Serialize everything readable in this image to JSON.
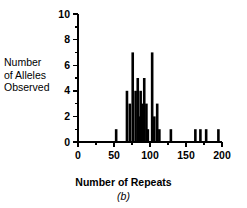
{
  "figure": {
    "caption_label": "(b)",
    "ylabel_line1": "Number",
    "ylabel_line2": "of Alleles",
    "ylabel_line3": "Observed",
    "xlabel": "Number of Repeats"
  },
  "chart_data": {
    "type": "bar",
    "title": "",
    "subtitle": "",
    "xlabel": "Number of Repeats",
    "ylabel": "Number of Alleles Observed",
    "xlim": [
      0,
      200
    ],
    "ylim": [
      0,
      10
    ],
    "xticks": [
      0,
      50,
      100,
      150,
      200
    ],
    "xtick_labels": [
      "0",
      "50",
      "100",
      "150",
      "200"
    ],
    "xminor_ticks": [
      25,
      75,
      125,
      175
    ],
    "yticks": [
      0,
      2,
      4,
      6,
      8,
      10
    ],
    "ytick_labels": [
      "0",
      "2",
      "4",
      "6",
      "8",
      "10"
    ],
    "yminor_ticks": [
      1,
      3,
      5,
      7,
      9
    ],
    "grid": false,
    "legend": null,
    "bar_color": "#000000",
    "categories": [
      53,
      68,
      72,
      76,
      80,
      83,
      85,
      87,
      89,
      92,
      95,
      97,
      103,
      106,
      110,
      113,
      129,
      163,
      170,
      178,
      195
    ],
    "values": [
      1,
      4,
      3,
      7,
      4,
      5,
      2,
      4,
      3,
      5,
      3,
      1,
      7,
      2,
      3,
      1,
      1,
      1,
      1,
      1,
      1
    ],
    "bars": [
      {
        "x": 53,
        "y": 1
      },
      {
        "x": 68,
        "y": 4
      },
      {
        "x": 72,
        "y": 3
      },
      {
        "x": 76,
        "y": 7
      },
      {
        "x": 80,
        "y": 4
      },
      {
        "x": 83,
        "y": 5
      },
      {
        "x": 85,
        "y": 2
      },
      {
        "x": 87,
        "y": 4
      },
      {
        "x": 89,
        "y": 3
      },
      {
        "x": 92,
        "y": 5
      },
      {
        "x": 95,
        "y": 3
      },
      {
        "x": 97,
        "y": 1
      },
      {
        "x": 103,
        "y": 7
      },
      {
        "x": 106,
        "y": 2
      },
      {
        "x": 110,
        "y": 3
      },
      {
        "x": 113,
        "y": 1
      },
      {
        "x": 129,
        "y": 1
      },
      {
        "x": 163,
        "y": 1
      },
      {
        "x": 170,
        "y": 1
      },
      {
        "x": 178,
        "y": 1
      },
      {
        "x": 195,
        "y": 1
      }
    ]
  }
}
